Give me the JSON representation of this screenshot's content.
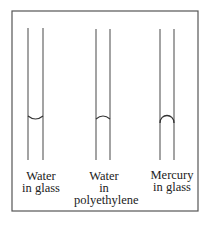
{
  "diagram": {
    "frame": {
      "x": 12,
      "y": 11,
      "width": 186,
      "height": 200,
      "stroke": "#555555"
    },
    "tube_color": "#666666",
    "tubes": [
      {
        "id": "water-in-glass",
        "left_x": 28,
        "right_x": 43,
        "top_y": 28,
        "bottom_y": 160,
        "meniscus": "concave",
        "meniscus_y": 116,
        "label_lines": [
          "Water",
          "in glass"
        ],
        "label_x": 40,
        "label_y": 170
      },
      {
        "id": "water-in-polyethylene",
        "left_x": 96,
        "right_x": 110,
        "top_y": 29,
        "bottom_y": 160,
        "meniscus": "convex",
        "meniscus_y": 118,
        "label_lines": [
          "Water",
          "in",
          "polyethylene"
        ],
        "label_x": 104,
        "label_y": 170
      },
      {
        "id": "mercury-in-glass",
        "left_x": 160,
        "right_x": 174,
        "top_y": 29,
        "bottom_y": 160,
        "meniscus": "convex-strong",
        "meniscus_y": 118,
        "label_lines": [
          "Mercury",
          "in glass"
        ],
        "label_x": 172,
        "label_y": 170
      }
    ]
  }
}
